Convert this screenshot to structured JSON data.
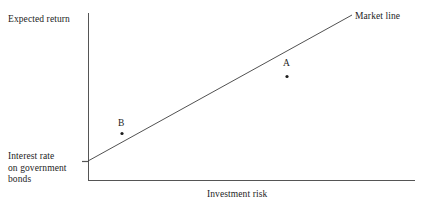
{
  "chart_data": {
    "type": "line",
    "title": "",
    "subtitle": "",
    "xlabel": "Investment risk",
    "ylabel": "Expected return",
    "grid": false,
    "legend": "none",
    "axis_origin_label": "Interest rate on government bonds",
    "axis_origin_label_lines": [
      "Interest rate",
      "on government",
      "bonds"
    ],
    "xlim": [
      0,
      1
    ],
    "ylim": [
      0,
      1
    ],
    "axes": {
      "x_axis_y_px": 180,
      "x_axis_from_px": 88,
      "x_axis_to_px": 415,
      "y_axis_x_px": 88,
      "y_axis_from_px": 13,
      "y_axis_to_px": 180,
      "tick_y_px": 161,
      "tick_x_from_px": 82,
      "tick_x_to_px": 89
    },
    "series": [
      {
        "name": "Market line",
        "type": "line",
        "annotation": "Market line",
        "points_px": [
          [
            88,
            161
          ],
          [
            352,
            15
          ]
        ],
        "x": [
          0.0,
          0.807
        ],
        "y": [
          0.114,
          0.988
        ],
        "color": "#3d3d3d"
      }
    ],
    "scatter_points": [
      {
        "label": "A",
        "x": 0.607,
        "y": 0.624,
        "point_px": [
          287,
          76
        ],
        "label_px": [
          286,
          64
        ],
        "color": "#1d1d1d"
      },
      {
        "label": "B",
        "x": 0.104,
        "y": 0.281,
        "point_px": [
          122,
          133
        ],
        "label_px": [
          121,
          124
        ],
        "color": "#1d1d1d"
      }
    ],
    "annotations": [
      {
        "text": "Market line",
        "x_px": 355,
        "y_px": 16
      },
      {
        "text": "A",
        "x_px": 286,
        "y_px": 64
      },
      {
        "text": "B",
        "x_px": 121,
        "y_px": 124
      }
    ],
    "colors": {
      "background": "#ffffff",
      "axis": "#555555",
      "line": "#3d3d3d",
      "text": "#1d1d1d",
      "marker": "#1d1d1d"
    }
  },
  "labels": {
    "y_axis": "Expected return",
    "x_axis": "Investment risk",
    "origin_line1": "Interest rate",
    "origin_line2": "on government",
    "origin_line3": "bonds",
    "market_line": "Market line",
    "point_a": "A",
    "point_b": "B"
  }
}
